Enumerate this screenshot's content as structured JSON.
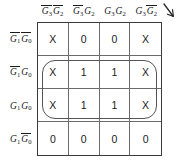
{
  "diagram": {
    "type": "karnaugh-map",
    "rows": 4,
    "cols": 4,
    "line_color": "#3a3a3a",
    "text_color": "#1a1a1a",
    "group_color": "#555555",
    "background": "#ffffff"
  },
  "column_headers": [
    {
      "id": "col-0",
      "text": "G3'G2'",
      "vars": [
        {
          "name": "G",
          "sub": "3",
          "bar": true
        },
        {
          "name": "G",
          "sub": "2",
          "bar": true
        }
      ]
    },
    {
      "id": "col-1",
      "text": "G3'G2",
      "vars": [
        {
          "name": "G",
          "sub": "3",
          "bar": true
        },
        {
          "name": "G",
          "sub": "2",
          "bar": false
        }
      ]
    },
    {
      "id": "col-2",
      "text": "G3G2",
      "vars": [
        {
          "name": "G",
          "sub": "3",
          "bar": false
        },
        {
          "name": "G",
          "sub": "2",
          "bar": false
        }
      ]
    },
    {
      "id": "col-3",
      "text": "G3G2'",
      "vars": [
        {
          "name": "G",
          "sub": "3",
          "bar": false
        },
        {
          "name": "G",
          "sub": "2",
          "bar": true
        }
      ]
    }
  ],
  "row_headers": [
    {
      "id": "row-0",
      "text": "G1'G0'",
      "vars": [
        {
          "name": "G",
          "sub": "1",
          "bar": true
        },
        {
          "name": "G",
          "sub": "0",
          "bar": true
        }
      ]
    },
    {
      "id": "row-1",
      "text": "G1'G0",
      "vars": [
        {
          "name": "G",
          "sub": "1",
          "bar": true
        },
        {
          "name": "G",
          "sub": "0",
          "bar": false
        }
      ]
    },
    {
      "id": "row-2",
      "text": "G1G0",
      "vars": [
        {
          "name": "G",
          "sub": "1",
          "bar": false
        },
        {
          "name": "G",
          "sub": "0",
          "bar": false
        }
      ]
    },
    {
      "id": "row-3",
      "text": "G1G0'",
      "vars": [
        {
          "name": "G",
          "sub": "1",
          "bar": false
        },
        {
          "name": "G",
          "sub": "0",
          "bar": true
        }
      ]
    }
  ],
  "cells": [
    [
      "X",
      "0",
      "0",
      "X"
    ],
    [
      "X",
      "1",
      "1",
      "X"
    ],
    [
      "X",
      "1",
      "1",
      "X"
    ],
    [
      "0",
      "0",
      "0",
      "0"
    ]
  ],
  "groups": [
    {
      "id": "group-1",
      "label": "grouping-oval",
      "row_start": 1,
      "row_end": 2,
      "col_start": 0,
      "col_end": 3
    }
  ],
  "arrow": {
    "name": "down-right-arrow",
    "glyph": "arrow"
  }
}
